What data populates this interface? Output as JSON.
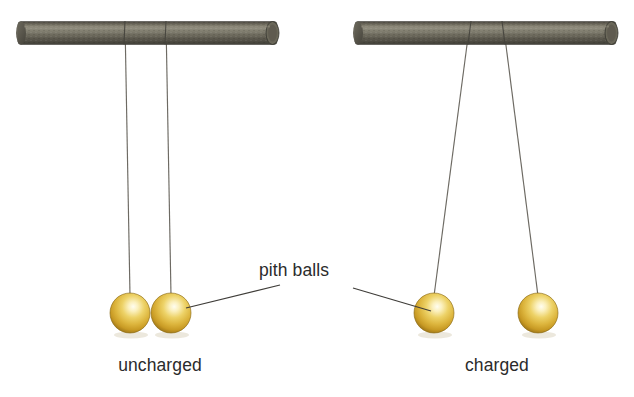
{
  "figure": {
    "background_color": "#ffffff"
  },
  "labels": {
    "left_caption": "uncharged",
    "right_caption": "charged",
    "annotation": "pith balls"
  },
  "colors": {
    "rod_light": "#8d8a7d",
    "rod_mid": "#6f6c60",
    "rod_dark": "#4a4840",
    "rod_edge": "#3c3a33",
    "ball_highlight": "#fdf6d2",
    "ball_mid": "#e8c64a",
    "ball_dark": "#c79a22",
    "ball_rim": "#8a6a14",
    "string": "#6d6a63",
    "leader_line": "#3f3d39",
    "text": "#2b2b2b"
  },
  "geometry": {
    "left_rod": {
      "x1": 18,
      "x2": 277,
      "cy": 33,
      "thickness": 23
    },
    "right_rod": {
      "x1": 355,
      "x2": 616,
      "cy": 33,
      "thickness": 23
    },
    "left_strings": [
      {
        "top_x": 125,
        "top_y": 24,
        "bottom_x": 130,
        "bottom_y": 296
      },
      {
        "top_x": 166,
        "top_y": 24,
        "bottom_x": 171,
        "bottom_y": 296
      }
    ],
    "right_strings": [
      {
        "top_x": 470,
        "top_y": 24,
        "bottom_x": 434,
        "bottom_y": 296
      },
      {
        "top_x": 503,
        "top_y": 24,
        "bottom_x": 538,
        "bottom_y": 296
      }
    ],
    "left_balls": [
      {
        "cx": 130,
        "cy": 313,
        "r": 20
      },
      {
        "cx": 171,
        "cy": 313,
        "r": 20
      }
    ],
    "right_balls": [
      {
        "cx": 434,
        "cy": 313,
        "r": 20
      },
      {
        "cx": 538,
        "cy": 313,
        "r": 20
      }
    ],
    "leader_left": {
      "x1": 186,
      "y1": 308,
      "x2": 280,
      "y2": 285
    },
    "leader_right": {
      "x1": 353,
      "y1": 288,
      "x2": 431,
      "y2": 311
    },
    "annotation_pos": {
      "x": 259,
      "y": 276
    },
    "left_caption_pos": {
      "x": 160,
      "y": 371
    },
    "right_caption_pos": {
      "x": 497,
      "y": 371
    }
  }
}
